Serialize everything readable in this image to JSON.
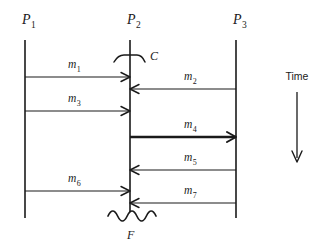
{
  "diagram": {
    "type": "message-sequence-chart",
    "title_text": "",
    "background_color": "#ffffff",
    "line_color": "#1a1a1a",
    "processes": [
      {
        "id": "P1",
        "base": "P",
        "subscript": "1",
        "x": 25,
        "label_x": 22,
        "label_y": 24,
        "top": 40,
        "bottom": 218
      },
      {
        "id": "P2",
        "base": "P",
        "subscript": "2",
        "x": 130,
        "label_x": 127,
        "label_y": 24,
        "top": 40,
        "bottom": 212
      },
      {
        "id": "P3",
        "base": "P",
        "subscript": "3",
        "x": 236,
        "label_x": 233,
        "label_y": 24,
        "top": 40,
        "bottom": 218
      }
    ],
    "messages": [
      {
        "id": "m1",
        "base": "m",
        "subscript": "1",
        "from": "P1",
        "to": "P2",
        "direction": "right",
        "y": 77,
        "x1": 25,
        "x2": 130,
        "label_x": 68,
        "label_y": 68,
        "bold": false
      },
      {
        "id": "m2",
        "base": "m",
        "subscript": "2",
        "from": "P3",
        "to": "P2",
        "direction": "left",
        "y": 89,
        "x1": 236,
        "x2": 130,
        "label_x": 184,
        "label_y": 80,
        "bold": false
      },
      {
        "id": "m3",
        "base": "m",
        "subscript": "3",
        "from": "P1",
        "to": "P2",
        "direction": "right",
        "y": 111,
        "x1": 25,
        "x2": 130,
        "label_x": 68,
        "label_y": 102,
        "bold": false
      },
      {
        "id": "m4",
        "base": "m",
        "subscript": "4",
        "from": "P2",
        "to": "P3",
        "direction": "right",
        "y": 137,
        "x1": 130,
        "x2": 236,
        "label_x": 184,
        "label_y": 128,
        "bold": true
      },
      {
        "id": "m5",
        "base": "m",
        "subscript": "5",
        "from": "P3",
        "to": "P2",
        "direction": "left",
        "y": 170,
        "x1": 236,
        "x2": 130,
        "label_x": 184,
        "label_y": 161,
        "bold": false
      },
      {
        "id": "m6",
        "base": "m",
        "subscript": "6",
        "from": "P1",
        "to": "P2",
        "direction": "right",
        "y": 191,
        "x1": 25,
        "x2": 130,
        "label_x": 68,
        "label_y": 182,
        "bold": false
      },
      {
        "id": "m7",
        "base": "m",
        "subscript": "7",
        "from": "P3",
        "to": "P2",
        "direction": "left",
        "y": 203,
        "x1": 236,
        "x2": 130,
        "label_x": 184,
        "label_y": 194,
        "bold": false
      }
    ],
    "markers": [
      {
        "id": "C",
        "label": "C",
        "kind": "checkpoint",
        "on_process": "P2",
        "y": 58,
        "label_x": 150,
        "label_y": 60
      },
      {
        "id": "F",
        "label": "F",
        "kind": "failure",
        "on_process": "P2",
        "y": 214,
        "label_x": 127,
        "label_y": 238
      }
    ],
    "time_axis": {
      "label": "Time",
      "label_x": 297,
      "label_y": 80,
      "x": 297,
      "y_start": 92,
      "y_end": 162,
      "direction": "down"
    }
  }
}
